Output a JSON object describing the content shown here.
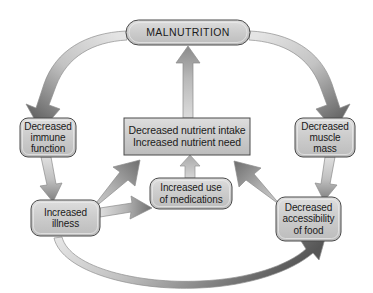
{
  "diagram": {
    "background_color": "#ffffff",
    "node_fill_color": "#c9c9c9",
    "node_border_color": "#4a4a4a",
    "arrow_light_color": "#dcdcdc",
    "arrow_dark_color": "#595959",
    "text_color": "#1a1a1a",
    "nodes": [
      {
        "id": "malnutrition",
        "label": "MALNUTRITION",
        "shape": "pill",
        "x": 126,
        "y": 20,
        "width": 124,
        "height": 25
      },
      {
        "id": "central",
        "label": "Decreased nutrient intake\nIncreased nutrient need",
        "shape": "rect",
        "x": 124,
        "y": 118,
        "width": 126,
        "height": 37
      },
      {
        "id": "immune",
        "label": "Decreased\nimmune\nfunction",
        "shape": "rounded",
        "x": 20,
        "y": 118,
        "width": 56,
        "height": 39
      },
      {
        "id": "muscle",
        "label": "Decreased\nmuscle\nmass",
        "shape": "rounded",
        "x": 295,
        "y": 118,
        "width": 60,
        "height": 39
      },
      {
        "id": "illness",
        "label": "Increased\nillness",
        "shape": "rounded",
        "x": 31,
        "y": 200,
        "width": 69,
        "height": 36
      },
      {
        "id": "access",
        "label": "Decreased\naccessibility\nof food",
        "shape": "rounded",
        "x": 276,
        "y": 197,
        "width": 65,
        "height": 44
      },
      {
        "id": "medications",
        "label": "Increased use\nof medications",
        "shape": "rounded",
        "x": 150,
        "y": 178,
        "width": 82,
        "height": 31
      }
    ],
    "edges": [
      {
        "id": "malnutrition-to-immune",
        "from": "malnutrition",
        "to": "immune",
        "style": "curved"
      },
      {
        "id": "malnutrition-to-muscle",
        "from": "malnutrition",
        "to": "muscle",
        "style": "curved"
      },
      {
        "id": "immune-to-illness",
        "from": "immune",
        "to": "illness",
        "style": "straight"
      },
      {
        "id": "muscle-to-access",
        "from": "muscle",
        "to": "access",
        "style": "straight"
      },
      {
        "id": "illness-to-central",
        "from": "illness",
        "to": "central",
        "style": "diagonal"
      },
      {
        "id": "illness-to-medications",
        "from": "illness",
        "to": "medications",
        "style": "straight"
      },
      {
        "id": "medications-to-central",
        "from": "medications",
        "to": "central",
        "style": "straight"
      },
      {
        "id": "access-to-central",
        "from": "access",
        "to": "central",
        "style": "diagonal"
      },
      {
        "id": "illness-to-access",
        "from": "illness",
        "to": "access",
        "style": "curved"
      },
      {
        "id": "central-to-malnutrition",
        "from": "central",
        "to": "malnutrition",
        "style": "straight"
      }
    ]
  }
}
